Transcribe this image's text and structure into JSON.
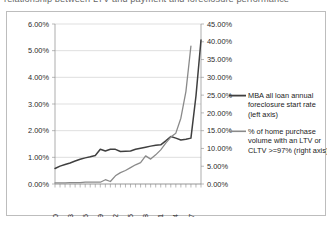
{
  "document": {
    "cut_off_line": "relationship between LTV and payment and foreclosure performance"
  },
  "chart_data": {
    "type": "line",
    "title": "",
    "xlabel": "",
    "ylabel": "",
    "grid": true,
    "legend_position": "right",
    "x_tick_labels": [
      "1980",
      "1983",
      "1986",
      "1989",
      "1992",
      "1995",
      "1998",
      "2001",
      "2004",
      "2007"
    ],
    "x_tick_years": [
      1980,
      1983,
      1986,
      1989,
      1992,
      1995,
      1998,
      2001,
      2004,
      2007
    ],
    "x_range": [
      1980,
      2009
    ],
    "left_axis": {
      "label": "",
      "ylim": [
        0,
        6
      ],
      "tick_labels": [
        "0.00%",
        "1.00%",
        "2.00%",
        "3.00%",
        "4.00%",
        "5.00%",
        "6.00%"
      ],
      "tick_values": [
        0,
        1,
        2,
        3,
        4,
        5,
        6
      ]
    },
    "right_axis": {
      "label": "",
      "ylim": [
        0,
        45
      ],
      "tick_labels": [
        "0.00%",
        "5.00%",
        "10.00%",
        "15.00%",
        "20.00%",
        "25.00%",
        "30.00%",
        "35.00%",
        "40.00%",
        "45.00%"
      ],
      "tick_values": [
        0,
        5,
        10,
        15,
        20,
        25,
        30,
        35,
        40,
        45
      ]
    },
    "series": [
      {
        "name": "MBA all loan annual foreclosure start rate (left axis)",
        "legend_label_lines": [
          "MBA all loan annual",
          "foreclosure start rate",
          "(left axis)"
        ],
        "axis": "left",
        "color": "#3f3f3f",
        "width": 1.5,
        "x": [
          1980,
          1981,
          1982,
          1983,
          1984,
          1985,
          1986,
          1987,
          1988,
          1989,
          1990,
          1991,
          1992,
          1993,
          1994,
          1995,
          1996,
          1997,
          1998,
          1999,
          2000,
          2001,
          2002,
          2003,
          2004,
          2005,
          2006,
          2007,
          2008,
          2009
        ],
        "values": [
          0.58,
          0.67,
          0.73,
          0.79,
          0.86,
          0.93,
          0.98,
          1.02,
          1.07,
          1.3,
          1.24,
          1.3,
          1.3,
          1.22,
          1.23,
          1.24,
          1.3,
          1.34,
          1.38,
          1.42,
          1.45,
          1.47,
          1.62,
          1.78,
          1.72,
          1.65,
          1.68,
          1.72,
          3.3,
          5.4
        ]
      },
      {
        "name": "% of home purchase volume with an LTV or CLTV >=97% (right axis)",
        "legend_label_lines": [
          "% of home purchase",
          "volume with an LTV or",
          "CLTV >=97% (right axis)"
        ],
        "axis": "right",
        "color": "#8a8a8a",
        "width": 1.3,
        "x": [
          1980,
          1981,
          1982,
          1983,
          1984,
          1985,
          1986,
          1987,
          1988,
          1989,
          1990,
          1991,
          1992,
          1993,
          1994,
          1995,
          1996,
          1997,
          1998,
          1999,
          2000,
          2001,
          2002,
          2003,
          2004,
          2005,
          2006,
          2007
        ],
        "values": [
          0.3,
          0.3,
          0.3,
          0.4,
          0.4,
          0.4,
          0.5,
          0.5,
          0.5,
          0.5,
          1.2,
          0.7,
          2.3,
          3.2,
          3.8,
          4.6,
          5.4,
          6.0,
          7.9,
          7.0,
          8.2,
          9.6,
          11.5,
          13.2,
          14.3,
          18.5,
          26.0,
          38.8
        ]
      }
    ]
  }
}
